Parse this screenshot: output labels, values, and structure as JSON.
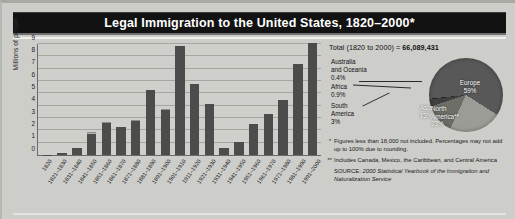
{
  "title": "Legal Immigration to the United States, 1820–2000*",
  "chart_data": {
    "type": "bar",
    "title": "Legal Immigration to the United States, 1820–2000*",
    "ylabel": "Millions of people",
    "xlabel": "",
    "ylim": [
      0,
      9
    ],
    "yticks": [
      "0",
      "1",
      "2",
      "3",
      "4",
      "5",
      "6",
      "7",
      "8",
      "9"
    ],
    "grid": true,
    "stacked": true,
    "legend": "none",
    "categories": [
      "1820",
      "1821–1830",
      "1831–1840",
      "1841–1850",
      "1851–1860",
      "1861–1870",
      "1871–1880",
      "1881–1890",
      "1891–1900",
      "1901–1910",
      "1911–1920",
      "1921–1930",
      "1931–1940",
      "1941–1950",
      "1951–1960",
      "1961–1970",
      "1971–1980",
      "1981–1990",
      "1991–2000"
    ],
    "series": [
      {
        "name": "main",
        "values": [
          0.01,
          0.13,
          0.54,
          1.71,
          2.6,
          2.31,
          2.81,
          5.25,
          3.69,
          8.8,
          5.74,
          4.11,
          0.53,
          1.04,
          2.52,
          3.32,
          4.49,
          7.34,
          9.1
        ]
      },
      {
        "name": "upper",
        "values": [
          0.0,
          0.0,
          0.0,
          0.12,
          0.1,
          0.0,
          0.01,
          0.0,
          0.01,
          0.0,
          0.0,
          0.0,
          0.0,
          0.0,
          0.0,
          0.0,
          0.0,
          0.0,
          0.0
        ]
      }
    ],
    "values": [
      0.01,
      0.14,
      0.6,
      1.71,
      2.6,
      2.31,
      2.81,
      5.25,
      3.69,
      8.8,
      5.74,
      4.11,
      0.53,
      1.04,
      2.52,
      3.32,
      4.49,
      7.34,
      9.1
    ]
  },
  "pie_panel": {
    "total_label": "Total (1820 to 2000) =",
    "total_value": "66,089,431",
    "chart_data": {
      "type": "pie",
      "title": "Total (1820 to 2000) = 66,089,431",
      "labels": [
        "Europe",
        "North America**",
        "Asia",
        "South America",
        "Africa",
        "Australia and Oceania"
      ],
      "values": [
        59,
        23,
        13,
        3,
        0.9,
        0.4
      ],
      "value_labels": [
        "59%",
        "23%",
        "13%",
        "3%",
        "0.9%",
        "0.4%"
      ]
    },
    "slices": [
      {
        "name": "Europe",
        "pct": "59%",
        "color": "#585858"
      },
      {
        "name": "North America**",
        "pct": "23%",
        "color": "#9c9c97"
      },
      {
        "name": "Asia",
        "pct": "13%",
        "color": "#6e6e69"
      },
      {
        "name": "South America",
        "pct": "3%",
        "color": "#3f3f3f"
      },
      {
        "name": "Africa",
        "pct": "0.9%",
        "color": "#262626"
      },
      {
        "name": "Australia and Oceania",
        "pct": "0.4%",
        "color": "#585858"
      }
    ],
    "europe_label": "Europe",
    "europe_pct": "59%",
    "north_america_label": "North\nAmerica**",
    "north_america_line1": "North",
    "north_america_line2": "America**",
    "north_america_pct": "23%",
    "asia_label": "Asia",
    "asia_pct": "13%",
    "south_america_line1": "South",
    "south_america_line2": "America",
    "south_america_pct": "3%",
    "africa_label": "Africa",
    "africa_pct": "0.9%",
    "oceania_line1": "Australia",
    "oceania_line2": "and Oceania",
    "oceania_pct": "0.4%"
  },
  "notes": {
    "marker1": "*",
    "note1": "Figures less than 18,000 not included. Percentages may not add up to 100% due to rounding.",
    "marker2": "**",
    "note2": "Includes Canada, Mexico, the Caribbean, and Central America",
    "source_label": "SOURCE:",
    "source_text": "2000 Statistical Yearbook of the Immigration and Naturalization Service"
  },
  "colors": {
    "bar_main": "#4c4c4c",
    "bar_top": "#b5b5b0",
    "title_bg": "#121212",
    "plot_bg": "#cfcfcb",
    "page_bg": "#cdcdc9"
  }
}
